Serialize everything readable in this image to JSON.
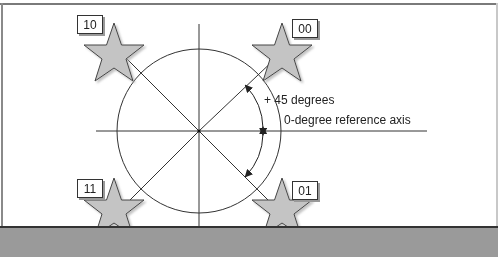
{
  "diagram": {
    "labels": {
      "top_left": "10",
      "top_right": "00",
      "bottom_left": "11",
      "bottom_right": "01"
    },
    "annotations": {
      "angle": "+ 45 degrees",
      "axis": "0-degree reference axis"
    },
    "colors": {
      "star_fill": "#c4c4c4",
      "star_stroke": "#444444",
      "line": "#333333",
      "bottom_bar": "#9a9a9a"
    }
  }
}
